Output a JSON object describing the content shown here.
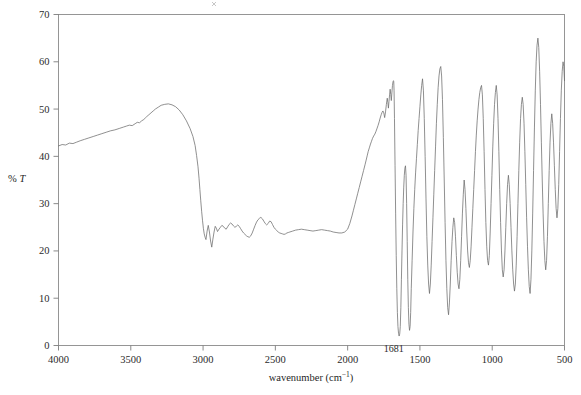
{
  "figure": {
    "background_color": "#ffffff",
    "trace_color": "#6b6b6b",
    "axis_color": "#8a8a8a"
  },
  "axes": {
    "x_title": "wavenumber (cm",
    "x_title_sup": "−1",
    "x_title_close": ")",
    "y_title_percent": "% ",
    "y_title_symbol": "T"
  },
  "chart_data": {
    "type": "line",
    "title": "",
    "subtitle": "",
    "xlabel": "wavenumber (cm−1)",
    "ylabel": "% T",
    "xlim": [
      4000,
      500
    ],
    "ylim": [
      0,
      70
    ],
    "x_reversed": true,
    "grid": false,
    "legend": null,
    "x_ticks": [
      4000,
      3500,
      3000,
      2500,
      2000,
      1500,
      1000,
      500
    ],
    "x_tick_labels": [
      "4000",
      "3500",
      "3000",
      "2500",
      "2000",
      "1500",
      "1000",
      "500"
    ],
    "y_ticks": [
      0,
      10,
      20,
      30,
      40,
      50,
      60,
      70
    ],
    "y_tick_labels": [
      "0",
      "10",
      "20",
      "30",
      "40",
      "50",
      "60",
      "70"
    ],
    "annotations": [
      {
        "text": "1681",
        "x": 1681,
        "y": 2.0,
        "label_offset_y": -6
      }
    ],
    "series": [
      {
        "name": "transmittance",
        "x": [
          4000,
          3975,
          3950,
          3925,
          3900,
          3875,
          3850,
          3820,
          3790,
          3760,
          3730,
          3700,
          3670,
          3640,
          3610,
          3580,
          3550,
          3530,
          3510,
          3490,
          3470,
          3455,
          3440,
          3425,
          3410,
          3400,
          3390,
          3375,
          3360,
          3345,
          3330,
          3310,
          3290,
          3265,
          3240,
          3215,
          3190,
          3165,
          3140,
          3115,
          3090,
          3070,
          3055,
          3045,
          3035,
          3028,
          3022,
          3016,
          3010,
          3004,
          2998,
          2992,
          2986,
          2980,
          2972,
          2964,
          2956,
          2948,
          2940,
          2932,
          2924,
          2916,
          2908,
          2900,
          2890,
          2880,
          2870,
          2860,
          2850,
          2840,
          2830,
          2820,
          2810,
          2800,
          2790,
          2780,
          2770,
          2760,
          2750,
          2740,
          2730,
          2720,
          2710,
          2700,
          2690,
          2680,
          2670,
          2660,
          2650,
          2640,
          2630,
          2620,
          2610,
          2600,
          2590,
          2580,
          2570,
          2560,
          2550,
          2540,
          2530,
          2520,
          2510,
          2500,
          2490,
          2480,
          2470,
          2460,
          2450,
          2440,
          2430,
          2420,
          2410,
          2400,
          2380,
          2360,
          2340,
          2320,
          2300,
          2280,
          2260,
          2240,
          2220,
          2200,
          2180,
          2160,
          2140,
          2120,
          2100,
          2080,
          2060,
          2040,
          2020,
          2000,
          1985,
          1970,
          1960,
          1950,
          1940,
          1930,
          1920,
          1910,
          1900,
          1890,
          1880,
          1872,
          1865,
          1858,
          1850,
          1842,
          1835,
          1828,
          1820,
          1812,
          1805,
          1798,
          1790,
          1782,
          1775,
          1768,
          1762,
          1756,
          1750,
          1744,
          1738,
          1732,
          1726,
          1722,
          1718,
          1714,
          1710,
          1706,
          1702,
          1698,
          1694,
          1690,
          1686,
          1683,
          1681,
          1679,
          1676,
          1672,
          1668,
          1664,
          1660,
          1656,
          1652,
          1648,
          1644,
          1640,
          1636,
          1632,
          1628,
          1624,
          1620,
          1616,
          1612,
          1608,
          1604,
          1600,
          1596,
          1592,
          1588,
          1584,
          1580,
          1576,
          1572,
          1568,
          1564,
          1560,
          1554,
          1548,
          1542,
          1536,
          1530,
          1524,
          1518,
          1512,
          1506,
          1500,
          1494,
          1488,
          1482,
          1476,
          1470,
          1464,
          1458,
          1452,
          1446,
          1440,
          1434,
          1428,
          1422,
          1416,
          1410,
          1404,
          1398,
          1392,
          1386,
          1380,
          1374,
          1368,
          1362,
          1356,
          1350,
          1344,
          1338,
          1332,
          1326,
          1320,
          1314,
          1308,
          1302,
          1296,
          1290,
          1284,
          1278,
          1272,
          1266,
          1260,
          1254,
          1248,
          1242,
          1236,
          1230,
          1224,
          1218,
          1212,
          1206,
          1200,
          1194,
          1188,
          1182,
          1176,
          1170,
          1164,
          1158,
          1152,
          1146,
          1140,
          1134,
          1128,
          1122,
          1116,
          1110,
          1104,
          1098,
          1092,
          1086,
          1080,
          1074,
          1068,
          1062,
          1056,
          1050,
          1044,
          1038,
          1032,
          1026,
          1020,
          1014,
          1008,
          1002,
          996,
          990,
          984,
          978,
          972,
          966,
          960,
          954,
          948,
          942,
          936,
          930,
          924,
          918,
          912,
          906,
          900,
          894,
          888,
          882,
          876,
          870,
          864,
          858,
          852,
          846,
          840,
          834,
          828,
          822,
          816,
          810,
          804,
          798,
          792,
          786,
          780,
          774,
          768,
          762,
          756,
          750,
          744,
          738,
          732,
          726,
          720,
          714,
          708,
          702,
          696,
          690,
          684,
          678,
          672,
          666,
          660,
          654,
          648,
          642,
          636,
          630,
          624,
          618,
          612,
          606,
          600,
          594,
          588,
          582,
          576,
          570,
          564,
          558,
          552,
          546,
          540,
          534,
          528,
          522,
          516,
          510,
          505,
          500
        ],
        "y": [
          42.2,
          42.5,
          42.4,
          42.8,
          42.7,
          43.0,
          43.3,
          43.6,
          43.9,
          44.2,
          44.5,
          44.8,
          45.1,
          45.4,
          45.6,
          45.9,
          46.2,
          46.4,
          46.6,
          46.5,
          46.9,
          47.2,
          47.1,
          47.5,
          47.8,
          48.1,
          48.4,
          48.8,
          49.2,
          49.6,
          50.0,
          50.4,
          50.8,
          51.0,
          51.1,
          50.9,
          50.5,
          49.8,
          48.8,
          47.5,
          45.9,
          44.2,
          42.3,
          40.2,
          37.8,
          35.4,
          33.0,
          30.6,
          28.4,
          26.5,
          24.8,
          23.6,
          22.9,
          22.4,
          24.2,
          25.4,
          24.0,
          22.1,
          20.8,
          22.5,
          24.0,
          25.2,
          24.8,
          24.1,
          24.6,
          25.0,
          25.4,
          25.2,
          24.8,
          24.6,
          25.1,
          25.6,
          25.9,
          25.7,
          25.3,
          25.0,
          25.2,
          25.5,
          25.2,
          24.7,
          24.2,
          23.8,
          23.5,
          23.2,
          23.0,
          22.9,
          23.2,
          23.8,
          24.6,
          25.4,
          26.1,
          26.6,
          26.9,
          27.1,
          26.8,
          26.3,
          25.8,
          25.5,
          25.8,
          26.3,
          26.2,
          25.6,
          25.0,
          24.6,
          24.3,
          24.0,
          23.8,
          23.7,
          23.6,
          23.5,
          23.6,
          23.8,
          23.9,
          24.0,
          24.2,
          24.4,
          24.5,
          24.6,
          24.5,
          24.4,
          24.3,
          24.2,
          24.3,
          24.4,
          24.5,
          24.4,
          24.3,
          24.2,
          24.0,
          23.9,
          23.8,
          23.8,
          24.0,
          24.6,
          25.8,
          27.4,
          28.6,
          29.8,
          31.0,
          32.2,
          33.4,
          34.6,
          35.8,
          37.0,
          38.2,
          39.2,
          40.1,
          41.0,
          41.8,
          42.6,
          43.2,
          43.8,
          44.3,
          44.7,
          45.2,
          45.8,
          46.5,
          47.3,
          48.1,
          48.8,
          49.3,
          49.6,
          49.2,
          48.2,
          49.4,
          51.0,
          52.3,
          51.4,
          50.2,
          51.6,
          53.0,
          54.2,
          53.1,
          51.8,
          53.4,
          55.0,
          55.8,
          56.0,
          55.8,
          54.0,
          48.0,
          38.0,
          28.0,
          19.0,
          12.0,
          7.0,
          4.0,
          2.6,
          2.0,
          2.4,
          4.0,
          8.0,
          14.0,
          20.0,
          25.5,
          30.0,
          33.5,
          36.0,
          37.5,
          38.0,
          36.0,
          30.0,
          22.0,
          14.0,
          8.0,
          4.5,
          3.2,
          4.0,
          7.0,
          12.0,
          18.0,
          24.0,
          29.0,
          33.0,
          36.5,
          39.5,
          42.5,
          45.5,
          48.0,
          50.5,
          53.0,
          55.0,
          56.4,
          54.0,
          48.0,
          40.0,
          31.0,
          23.0,
          17.0,
          13.0,
          11.0,
          13.0,
          17.0,
          22.0,
          27.0,
          32.0,
          37.0,
          42.0,
          47.0,
          51.0,
          54.5,
          57.0,
          58.5,
          59.0,
          57.0,
          52.0,
          44.0,
          35.0,
          26.0,
          18.0,
          12.0,
          8.0,
          6.5,
          9.0,
          13.0,
          18.0,
          22.0,
          25.0,
          27.0,
          26.0,
          23.0,
          19.0,
          15.5,
          13.0,
          12.0,
          14.0,
          18.0,
          23.0,
          28.0,
          32.0,
          35.0,
          33.0,
          29.0,
          24.0,
          20.0,
          17.5,
          16.5,
          18.0,
          21.0,
          25.0,
          29.0,
          33.0,
          37.0,
          41.0,
          44.5,
          47.5,
          50.0,
          52.0,
          53.5,
          54.5,
          55.0,
          53.0,
          48.0,
          41.0,
          33.0,
          26.0,
          21.0,
          18.0,
          17.0,
          19.0,
          24.0,
          30.0,
          36.0,
          42.0,
          47.0,
          51.0,
          53.5,
          55.0,
          53.0,
          48.0,
          41.0,
          33.0,
          26.0,
          20.0,
          16.0,
          14.5,
          16.0,
          20.0,
          25.0,
          30.0,
          34.0,
          36.0,
          34.0,
          30.0,
          25.0,
          20.0,
          16.0,
          13.0,
          11.5,
          13.0,
          17.0,
          23.0,
          30.0,
          37.0,
          43.0,
          48.0,
          51.0,
          52.5,
          51.0,
          47.0,
          41.0,
          34.0,
          27.0,
          21.0,
          16.0,
          12.5,
          11.0,
          14.0,
          20.0,
          28.0,
          37.0,
          46.0,
          54.0,
          60.0,
          63.5,
          65.0,
          63.0,
          58.0,
          51.0,
          43.0,
          35.0,
          28.0,
          22.0,
          18.0,
          16.0,
          18.0,
          23.0,
          30.0,
          37.0,
          43.0,
          47.0,
          49.0,
          47.0,
          43.0,
          38.0,
          33.0,
          29.0,
          27.0,
          29.0,
          34.0,
          41.0,
          48.0,
          54.0,
          58.0,
          60.0,
          59.0,
          56.0
        ]
      }
    ]
  }
}
